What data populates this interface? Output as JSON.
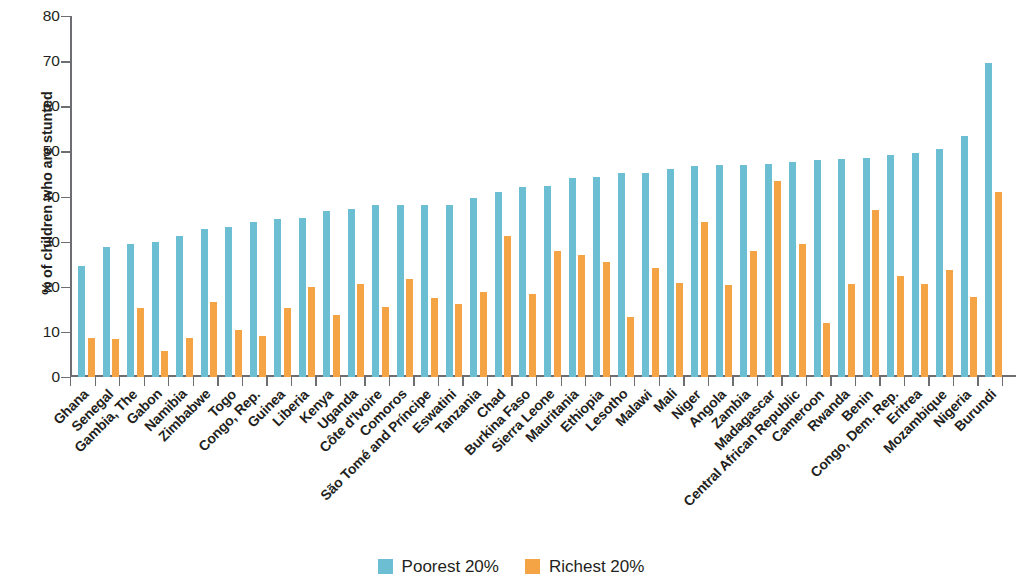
{
  "chart_data": {
    "type": "bar",
    "title": "",
    "subtitle": "",
    "xlabel": "",
    "ylabel": "% of children who are stunted",
    "ylim": [
      0,
      80
    ],
    "ytick_step": 10,
    "yticks": [
      0,
      10,
      20,
      30,
      40,
      50,
      60,
      70,
      80
    ],
    "grid": false,
    "legend_position": "bottom-center",
    "orientation": "vertical",
    "categories": [
      "Ghana",
      "Senegal",
      "Gambia, The",
      "Gabon",
      "Namibia",
      "Zimbabwe",
      "Togo",
      "Congo, Rep.",
      "Guinea",
      "Liberia",
      "Kenya",
      "Uganda",
      "Côte d'Ivoire",
      "Comoros",
      "São Tomé and Príncipe",
      "Eswatini",
      "Tanzania",
      "Chad",
      "Burkina Faso",
      "Sierra Leone",
      "Mauritania",
      "Ethiopia",
      "Lesotho",
      "Malawi",
      "Mali",
      "Niger",
      "Angola",
      "Zambia",
      "Madagascar",
      "Central African Republic",
      "Cameroon",
      "Rwanda",
      "Benin",
      "Congo, Dem. Rep.",
      "Eritrea",
      "Mozambique",
      "Nigeria",
      "Burundi"
    ],
    "series": [
      {
        "name": "Poorest 20%",
        "color": "#6CBFD2",
        "values": [
          24.7,
          28.8,
          29.5,
          29.9,
          31.2,
          32.9,
          33.3,
          34.4,
          35.1,
          35.3,
          36.9,
          37.3,
          38.1,
          38.2,
          38.1,
          38.2,
          39.6,
          41.1,
          42.0,
          42.4,
          44.0,
          44.3,
          45.2,
          45.3,
          46.0,
          46.8,
          46.9,
          46.9,
          47.1,
          47.7,
          48.2,
          48.3,
          48.6,
          49.3,
          49.6,
          50.6,
          53.4,
          69.5
        ]
      },
      {
        "name": "Richest 20%",
        "color": "#F4A345",
        "values": [
          8.6,
          8.5,
          15.2,
          5.8,
          8.7,
          16.6,
          10.5,
          9.1,
          15.2,
          19.9,
          13.8,
          20.7,
          15.6,
          21.7,
          17.5,
          16.2,
          18.9,
          31.3,
          18.4,
          27.9,
          27.0,
          25.4,
          13.3,
          24.1,
          20.9,
          34.4,
          20.3,
          28.0,
          43.4,
          29.5,
          12.0,
          20.7,
          37.1,
          22.4,
          20.7,
          23.8,
          17.7,
          41.0
        ]
      }
    ]
  },
  "legend": {
    "items": [
      {
        "label": "Poorest 20%",
        "color": "#6CBFD2"
      },
      {
        "label": "Richest 20%",
        "color": "#F4A345"
      }
    ]
  }
}
